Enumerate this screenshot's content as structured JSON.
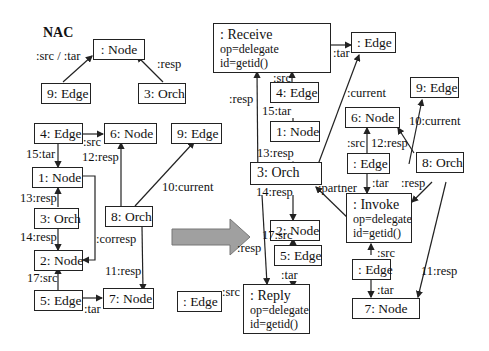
{
  "nac": {
    "title": "NAC",
    "nodes": {
      "node": ": Node",
      "edge9": "9: Edge",
      "orch3": "3: Orch"
    },
    "labels": {
      "src_tar": ":src / :tar",
      "resp": ":resp"
    }
  },
  "lhs": {
    "nodes": {
      "edge4": "4: Edge",
      "node6": "6: Node",
      "edge9": "9: Edge",
      "node1": "1: Node",
      "orch3": "3: Orch",
      "orch8": "8: Orch",
      "node2": "2: Node",
      "edge5": "5: Edge",
      "node7": "7: Node"
    },
    "labels": {
      "src": ":src",
      "tar15": "15:tar",
      "resp12": "12:resp",
      "current10": "10:current",
      "resp13": "13:resp",
      "resp14": "14:resp",
      "corresp": ":corresp",
      "src17": "17:src",
      "resp11": "11:resp",
      "tar": ":tar"
    }
  },
  "transform_arrow": {
    "color": "#a0a0a0"
  },
  "rhs": {
    "receive": {
      "title": ": Receive",
      "op": "op=delegate",
      "id": "id=getid()"
    },
    "reply": {
      "title": ": Reply",
      "op": "op=delegate",
      "id": "id=getid()"
    },
    "invoke": {
      "title": ": Invoke",
      "op": "op=delegate",
      "id": "id=getid()"
    },
    "nodes": {
      "edge_top": ": Edge",
      "edge4": "4: Edge",
      "node1": "1: Node",
      "orch3": "3: Orch",
      "node2": "2: Node",
      "edge5": "5: Edge",
      "edge_left": ": Edge",
      "edge9": "9: Edge",
      "node6": "6: Node",
      "edge_mid": ": Edge",
      "orch8": "8: Orch",
      "edge_low": ": Edge",
      "node7": "7: Node"
    },
    "labels": {
      "tar_top": ":tar",
      "src_receive": ":src",
      "resp_left": ":resp",
      "tar15": "15:tar",
      "resp13": "13:resp",
      "current": ":current",
      "resp14": "14:resp",
      "partner": ":partner",
      "src17": "17:src",
      "resp_mid": ":resp",
      "tar_reply": ":tar",
      "src_reply": ":src",
      "current10": "10:current",
      "src6": ":src",
      "resp12": "12:resp",
      "tar_invoke": ":tar",
      "resp8": ":resp",
      "src_invoke": ":src",
      "tar_low": ":tar",
      "resp11": "11:resp"
    }
  }
}
